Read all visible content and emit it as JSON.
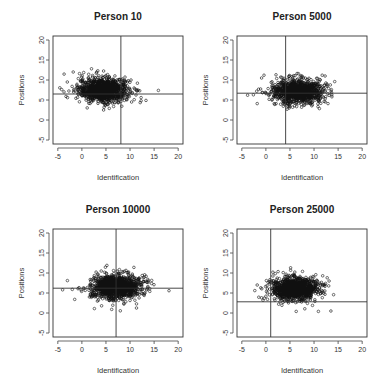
{
  "chart_data": [
    {
      "type": "scatter",
      "title": "Person  10",
      "xlabel": "Identification",
      "ylabel": "Positions",
      "xlim": [
        -6,
        21
      ],
      "ylim": [
        -6,
        21
      ],
      "xticks": [
        -5,
        0,
        5,
        10,
        15,
        20
      ],
      "yticks": [
        -5,
        0,
        5,
        10,
        15,
        20
      ],
      "grid": false,
      "reference_lines": {
        "vertical_x": 8.1,
        "horizontal_y": 6.5
      },
      "cloud": {
        "n": 1100,
        "x_mean": 4.5,
        "x_sd": 2.6,
        "y_mean": 7.5,
        "y_sd": 1.5
      },
      "outliers": [
        [
          -4.2,
          7.6
        ],
        [
          -3.3,
          5.9
        ],
        [
          -1.8,
          12.0
        ],
        [
          2.0,
          12.8
        ],
        [
          3.3,
          12.3
        ],
        [
          4.5,
          2.5
        ],
        [
          12.3,
          5.6
        ],
        [
          15.9,
          7.4
        ],
        [
          12.0,
          7.3
        ],
        [
          10.2,
          10.0
        ]
      ]
    },
    {
      "type": "scatter",
      "title": "Person  5000",
      "xlabel": "Identification",
      "ylabel": "Positions",
      "xlim": [
        -6,
        21
      ],
      "ylim": [
        -6,
        21
      ],
      "xticks": [
        -5,
        0,
        5,
        10,
        15,
        20
      ],
      "yticks": [
        -5,
        0,
        5,
        10,
        15,
        20
      ],
      "grid": false,
      "reference_lines": {
        "vertical_x": 4.1,
        "horizontal_y": 6.7
      },
      "cloud": {
        "n": 1100,
        "x_mean": 6.5,
        "x_sd": 2.6,
        "y_mean": 7.2,
        "y_sd": 1.5
      },
      "outliers": [
        [
          -3.8,
          6.2
        ],
        [
          -2.6,
          6.3
        ],
        [
          -1.9,
          7.2
        ],
        [
          -1.8,
          4.1
        ],
        [
          -0.9,
          10.5
        ],
        [
          -0.4,
          11.2
        ],
        [
          2.1,
          11.3
        ],
        [
          14.3,
          9.6
        ],
        [
          13.7,
          5.8
        ],
        [
          12.9,
          4.1
        ],
        [
          4.4,
          2.7
        ]
      ]
    },
    {
      "type": "scatter",
      "title": "Person  10000",
      "xlabel": "Identification",
      "ylabel": "Positions",
      "xlim": [
        -6,
        21
      ],
      "ylim": [
        -6,
        21
      ],
      "xticks": [
        -5,
        0,
        5,
        10,
        15,
        20
      ],
      "yticks": [
        -5,
        0,
        5,
        10,
        15,
        20
      ],
      "grid": false,
      "reference_lines": {
        "vertical_x": 7.1,
        "horizontal_y": 6.2
      },
      "cloud": {
        "n": 1200,
        "x_mean": 7.0,
        "x_sd": 2.5,
        "y_mean": 6.5,
        "y_sd": 1.5
      },
      "outliers": [
        [
          -4.0,
          5.8
        ],
        [
          -3.0,
          8.1
        ],
        [
          -2.0,
          5.9
        ],
        [
          -1.5,
          3.4
        ],
        [
          2.6,
          1.1
        ],
        [
          6.2,
          0.9
        ],
        [
          4.1,
          1.8
        ],
        [
          5.2,
          11.9
        ],
        [
          10.8,
          11.4
        ],
        [
          14.1,
          5.4
        ],
        [
          13.0,
          4.9
        ]
      ]
    },
    {
      "type": "scatter",
      "title": "Person  25000",
      "xlabel": "Identification",
      "ylabel": "Positions",
      "xlim": [
        -6,
        21
      ],
      "ylim": [
        -6,
        21
      ],
      "xticks": [
        -5,
        0,
        5,
        10,
        15,
        20
      ],
      "yticks": [
        -5,
        0,
        5,
        10,
        15,
        20
      ],
      "grid": false,
      "reference_lines": {
        "vertical_x": 1.0,
        "horizontal_y": 2.8
      },
      "cloud": {
        "n": 1200,
        "x_mean": 6.0,
        "x_sd": 2.4,
        "y_mean": 6.0,
        "y_sd": 1.4
      },
      "outliers": [
        [
          -2.3,
          5.6
        ],
        [
          -1.8,
          7.0
        ],
        [
          -0.9,
          3.8
        ],
        [
          -0.6,
          3.2
        ],
        [
          0.1,
          8.1
        ],
        [
          6.3,
          0.4
        ],
        [
          10.9,
          0.4
        ],
        [
          13.5,
          0.5
        ],
        [
          12.4,
          7.4
        ],
        [
          11.8,
          9.3
        ],
        [
          3.6,
          10.1
        ],
        [
          7.6,
          10.4
        ]
      ]
    }
  ]
}
